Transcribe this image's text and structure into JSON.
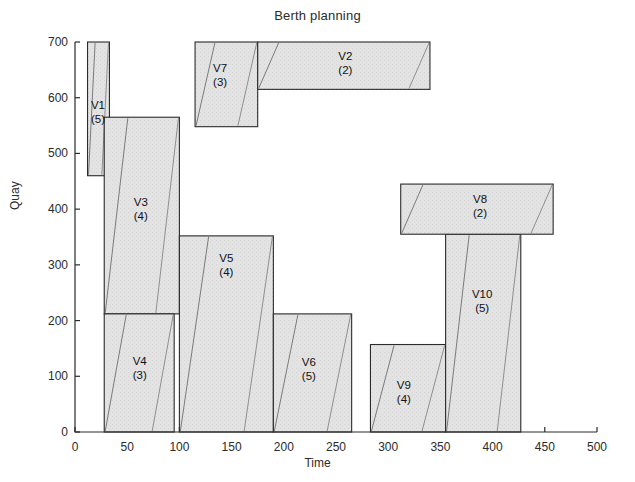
{
  "chart_data": {
    "type": "bar",
    "title": "Berth planning",
    "xlabel": "Time",
    "ylabel": "Quay",
    "xlim": [
      0,
      500
    ],
    "ylim": [
      0,
      700
    ],
    "xticks": [
      0,
      50,
      100,
      150,
      200,
      250,
      300,
      350,
      400,
      450,
      500
    ],
    "yticks": [
      0,
      100,
      200,
      300,
      400,
      500,
      600,
      700
    ],
    "grid": false,
    "legend": "none",
    "note": "Gantt-style berth allocation: each rectangle is a vessel occupying a quay segment (y extent) over a time window (x extent). Parenthesised number is the number of assigned quay cranes. Thin diagonal lines inside each rectangle show the cumulative handling/processing progress.",
    "series": [
      {
        "name": "V1",
        "cranes": 5,
        "label": "V1",
        "qty_label": "(5)",
        "time_start": 12,
        "time_end": 33,
        "quay_start": 460,
        "quay_end": 700,
        "label_x": 22,
        "label_y": 575
      },
      {
        "name": "V3",
        "cranes": 4,
        "label": "V3",
        "qty_label": "(4)",
        "time_start": 28,
        "time_end": 100,
        "quay_start": 212,
        "quay_end": 565,
        "label_x": 63,
        "label_y": 400
      },
      {
        "name": "V4",
        "cranes": 3,
        "label": "V4",
        "qty_label": "(3)",
        "time_start": 28,
        "time_end": 95,
        "quay_start": 0,
        "quay_end": 212,
        "label_x": 62,
        "label_y": 115
      },
      {
        "name": "V7",
        "cranes": 3,
        "label": "V7",
        "qty_label": "(3)",
        "time_start": 115,
        "time_end": 175,
        "quay_start": 548,
        "quay_end": 700,
        "label_x": 139,
        "label_y": 640
      },
      {
        "name": "V2",
        "cranes": 2,
        "label": "V2",
        "qty_label": "(2)",
        "time_start": 175,
        "time_end": 340,
        "quay_start": 615,
        "quay_end": 700,
        "label_x": 259,
        "label_y": 663
      },
      {
        "name": "V5",
        "cranes": 4,
        "label": "V5",
        "qty_label": "(4)",
        "time_start": 100,
        "time_end": 190,
        "quay_start": 0,
        "quay_end": 352,
        "label_x": 145,
        "label_y": 300
      },
      {
        "name": "V6",
        "cranes": 5,
        "label": "V6",
        "qty_label": "(5)",
        "time_start": 190,
        "time_end": 265,
        "quay_start": 0,
        "quay_end": 212,
        "label_x": 224,
        "label_y": 113
      },
      {
        "name": "V9",
        "cranes": 4,
        "label": "V9",
        "qty_label": "(4)",
        "time_start": 283,
        "time_end": 355,
        "quay_start": 0,
        "quay_end": 157,
        "label_x": 315,
        "label_y": 72
      },
      {
        "name": "V10",
        "cranes": 5,
        "label": "V10",
        "qty_label": "(5)",
        "time_start": 355,
        "time_end": 427,
        "quay_start": 0,
        "quay_end": 355,
        "label_x": 390,
        "label_y": 235
      },
      {
        "name": "V8",
        "cranes": 2,
        "label": "V8",
        "qty_label": "(2)",
        "time_start": 312,
        "time_end": 458,
        "quay_start": 355,
        "quay_end": 445,
        "label_x": 388,
        "label_y": 405
      }
    ]
  }
}
